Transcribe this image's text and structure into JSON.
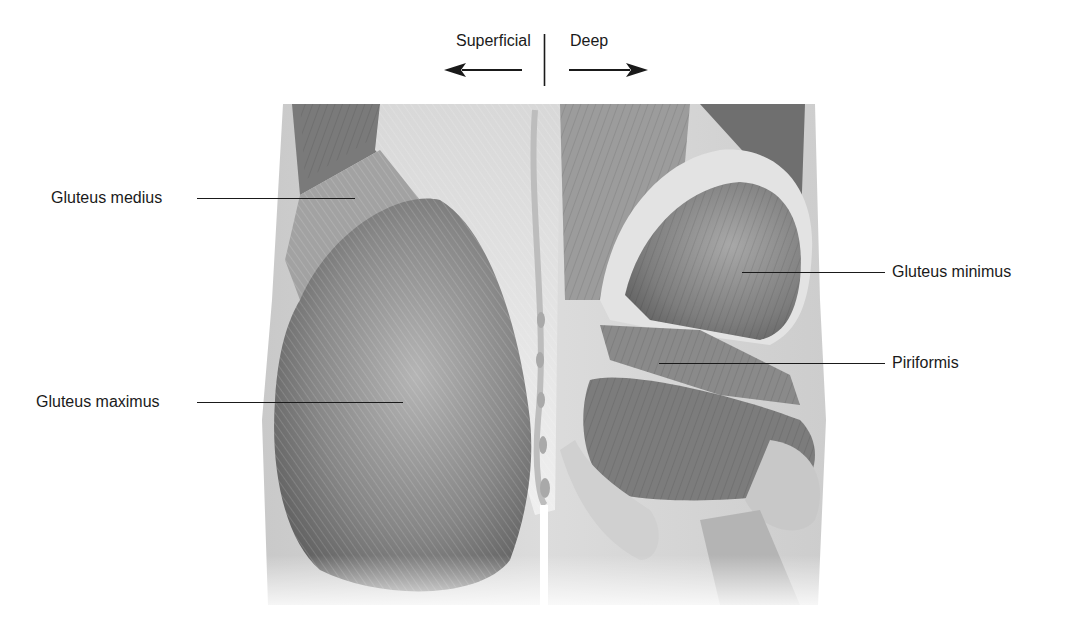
{
  "diagram": {
    "type": "anatomical-illustration",
    "orientation": {
      "left_label": "Superficial",
      "right_label": "Deep",
      "left_arrow": "arrow-left",
      "right_arrow": "arrow-right"
    },
    "labels": [
      {
        "id": "gluteus-medius",
        "text": "Gluteus medius",
        "side": "left"
      },
      {
        "id": "gluteus-maximus",
        "text": "Gluteus maximus",
        "side": "left"
      },
      {
        "id": "gluteus-minimus",
        "text": "Gluteus minimus",
        "side": "right"
      },
      {
        "id": "piriformis",
        "text": "Piriformis",
        "side": "right"
      }
    ],
    "colors": {
      "text": "#1a1a1a",
      "skin_edge": "#d6d6d6",
      "muscle_dark": "#6e6e6e",
      "muscle_mid": "#9a9a9a",
      "muscle_light": "#cfcfcf",
      "fascia": "#ececec",
      "background": "#ffffff"
    }
  }
}
